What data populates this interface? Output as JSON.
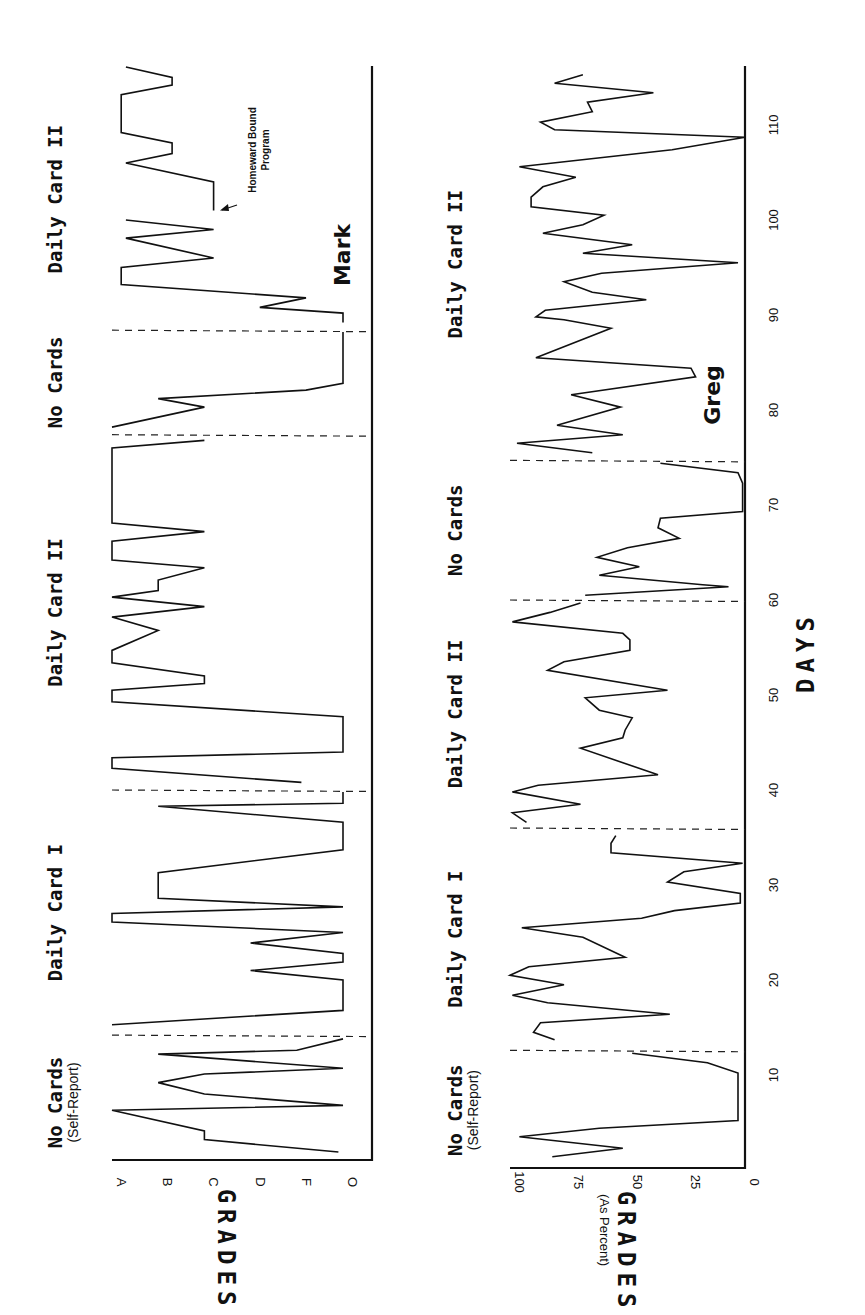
{
  "figure": {
    "orientation": "rotated-90-ccw",
    "x_axis_title": "DAYS",
    "y_axis_title": "GRADES",
    "greg_y_axis_subtitle": "(As Percent)"
  },
  "chart_data": [
    {
      "type": "line",
      "title": "Mark",
      "xlabel": "DAYS",
      "ylabel": "GRADES",
      "ytick_labels": [
        "O",
        "F",
        "D",
        "C",
        "B",
        "A"
      ],
      "ytick_values": [
        0,
        1,
        2,
        3,
        4,
        5
      ],
      "ylim": [
        0,
        5
      ],
      "xlim": [
        0,
        116
      ],
      "grid": false,
      "phases": [
        {
          "label": "No Cards",
          "sublabel": "(Self-Report)",
          "start": 0,
          "end": 14.2
        },
        {
          "label": "Daily Card I",
          "sublabel": "",
          "start": 14.2,
          "end": 40
        },
        {
          "label": "Daily Card II",
          "sublabel": "",
          "start": 40,
          "end": 77.4
        },
        {
          "label": "No Cards",
          "sublabel": "",
          "start": 77.4,
          "end": 88.4
        },
        {
          "label": "Daily Card II",
          "sublabel": "",
          "start": 88.4,
          "end": 116
        }
      ],
      "annotations": [
        {
          "text": "Homeward Bound Program",
          "day": 101,
          "grade": 2.8
        }
      ],
      "segments": [
        {
          "x": [
            1.9,
            3.2,
            4.1,
            6.3,
            6.8,
            8.0,
            9.2,
            10.1,
            10.7,
            12.2,
            12.6,
            13.8
          ],
          "y": [
            0.1,
            3.0,
            3.0,
            5.0,
            0.0,
            3.0,
            4.0,
            3.0,
            0.0,
            4.0,
            1.0,
            0.0
          ]
        },
        {
          "x": [
            15.3,
            16.8,
            20.0,
            21.0,
            21.9,
            22.8,
            23.9,
            25.0,
            26.1,
            27.0,
            27.7,
            28.6,
            31.3,
            33.7,
            36.6,
            38.3,
            38.6,
            39.8
          ],
          "y": [
            5.0,
            0.0,
            0.0,
            2.0,
            0.0,
            0.0,
            2.0,
            0.0,
            5.0,
            5.0,
            0.0,
            4.0,
            4.0,
            0.0,
            0.0,
            4.0,
            0.0,
            0.0
          ]
        },
        {
          "x": [
            40.8,
            42.3,
            43.4,
            44.0,
            47.7,
            49.3,
            50.5,
            51.2,
            52.0,
            53.4,
            54.7,
            56.8,
            58.2,
            59.3,
            60.3,
            61.0,
            62.1,
            63.4,
            64.2,
            66.2,
            67.2,
            68.1,
            76.0,
            76.8
          ],
          "y": [
            0.9,
            5.0,
            5.0,
            0.0,
            0.0,
            5.0,
            5.0,
            3.0,
            3.0,
            5.0,
            5.0,
            4.0,
            5.0,
            3.0,
            5.0,
            4.0,
            4.0,
            3.0,
            5.0,
            5.0,
            3.0,
            5.0,
            5.0,
            3.0
          ]
        },
        {
          "x": [
            78.2,
            80.3,
            81.2,
            82.1,
            82.8,
            88.2
          ],
          "y": [
            5.0,
            3.0,
            4.0,
            0.8,
            0.0,
            0.0
          ]
        },
        {
          "x": [
            89.2,
            90.2,
            90.8,
            91.8,
            93.2,
            95.0,
            96.0,
            98.1,
            99.0,
            100.0
          ],
          "y": [
            0.0,
            0.0,
            1.8,
            0.8,
            4.8,
            4.8,
            2.8,
            4.7,
            2.8,
            4.7
          ]
        },
        {
          "x": [
            101.0,
            104.0,
            106.0,
            107.0,
            108.1,
            109.2,
            113.2,
            114.2,
            115.0,
            116.1
          ],
          "y": [
            2.8,
            2.8,
            4.7,
            3.7,
            3.7,
            4.8,
            4.8,
            3.7,
            3.7,
            4.7
          ]
        }
      ]
    },
    {
      "type": "line",
      "title": "Greg",
      "xlabel": "DAYS",
      "ylabel": "GRADES (As Percent)",
      "ytick_labels": [
        "0",
        "25",
        "50",
        "75",
        "100"
      ],
      "ytick_values": [
        0,
        25,
        50,
        75,
        100
      ],
      "ylim": [
        0,
        100
      ],
      "xtick_labels": [
        "10",
        "20",
        "30",
        "40",
        "50",
        "60",
        "70",
        "80",
        "90",
        "100",
        "110"
      ],
      "xtick_values": [
        10,
        20,
        30,
        40,
        50,
        60,
        70,
        80,
        90,
        100,
        110
      ],
      "xlim": [
        0,
        116
      ],
      "grid": false,
      "phases": [
        {
          "label": "No Cards",
          "sublabel": "(Self-Report)",
          "start": 0,
          "end": 12.6
        },
        {
          "label": "Daily Card I",
          "sublabel": "",
          "start": 12.6,
          "end": 36
        },
        {
          "label": "Daily Card II",
          "sublabel": "",
          "start": 36,
          "end": 60
        },
        {
          "label": "No Cards",
          "sublabel": "",
          "start": 60,
          "end": 74.7
        },
        {
          "label": "Daily Card II",
          "sublabel": "",
          "start": 74.7,
          "end": 116
        }
      ],
      "segments": [
        {
          "x": [
            1.4,
            2.3,
            3.5,
            4.4,
            5.2,
            10.2,
            11.3,
            12.3
          ],
          "y": [
            82,
            52,
            96,
            62,
            3,
            3,
            16,
            48
          ]
        },
        {
          "x": [
            13.7,
            14.5,
            15.5,
            16.4,
            17.6,
            18.4,
            19.5,
            20.5,
            21.4,
            22.4,
            24.5,
            25.5,
            26.5,
            27.3,
            28.1,
            29.1,
            30.3,
            31.4,
            32.3,
            33.4,
            34.4,
            35.2
          ],
          "y": [
            81,
            90,
            87,
            32,
            84,
            99,
            77,
            100,
            92,
            51,
            69,
            95,
            44,
            30,
            2,
            2,
            33,
            26,
            1,
            57,
            57,
            55
          ]
        },
        {
          "x": [
            36.6,
            37.6,
            38.5,
            39.8,
            40.5,
            41.6,
            44.4,
            45.5,
            46.3,
            47.6,
            48.4,
            49.7,
            50.5,
            52.6,
            53.5,
            54.7,
            55.8,
            56.5,
            57.7,
            58.7,
            59.7
          ],
          "y": [
            93,
            99,
            70,
            99,
            88,
            37,
            70,
            52,
            51,
            48,
            62,
            68,
            33,
            84,
            77,
            49,
            49,
            52,
            99,
            83,
            70
          ]
        },
        {
          "x": [
            60.5,
            61.4,
            61.6,
            62.6,
            63.5,
            64.5,
            65.5,
            66.5,
            67.6,
            68.6,
            69.3,
            72.3,
            73.4,
            74.4
          ],
          "y": [
            68,
            7,
            18,
            62,
            45,
            63,
            50,
            28,
            37,
            36,
            1,
            1,
            3,
            36
          ]
        },
        {
          "x": [
            75.5,
            76.5,
            77.4,
            78.4,
            80.3,
            81.6,
            83.5,
            84.4,
            85.5,
            88.6,
            89.5,
            89.8,
            90.5,
            91.6,
            92.4,
            93.5,
            94.4,
            95.5,
            96.5,
            97.4,
            98.6,
            99.5,
            100.5,
            101.4,
            102.4,
            103.5,
            104.5,
            105.6,
            107.4,
            108.7,
            109.5,
            110.3,
            111.4,
            112.4,
            113.4,
            114.4,
            115.3
          ],
          "y": [
            65,
            97,
            52,
            80,
            53,
            74,
            21,
            23,
            89,
            57,
            77,
            89,
            85,
            42,
            65,
            77,
            61,
            3,
            69,
            48,
            86,
            69,
            60,
            91,
            91,
            86,
            72,
            96,
            31,
            0,
            81,
            87,
            65,
            67,
            39,
            81,
            69
          ]
        }
      ]
    }
  ]
}
